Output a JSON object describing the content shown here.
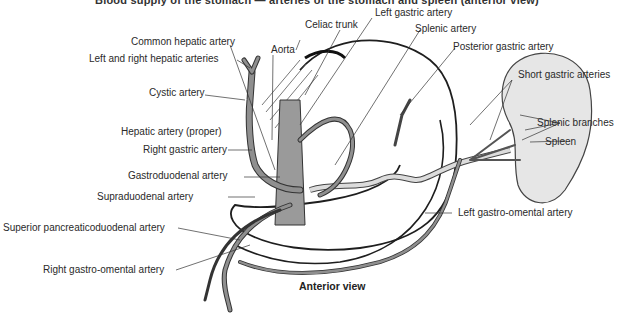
{
  "figure": {
    "caption_truncated": "Blood supply of the stomach — arteries of the stomach and spleen (anterior view)",
    "view_label": "Anterior view",
    "colors": {
      "artery_fill": "#8f8f8f",
      "artery_outline": "#333333",
      "spleen_fill": "#e6e6e6",
      "stomach_outline": "#1e1e1e",
      "splenic_artery_fill": "#dcdcdc"
    },
    "labels": {
      "left_gastric_artery": "Left gastric artery",
      "celiac_trunk": "Celiac trunk",
      "splenic_artery": "Splenic artery",
      "common_hepatic_artery": "Common hepatic artery",
      "aorta": "Aorta",
      "posterior_gastric_artery": "Posterior gastric artery",
      "left_right_hepatic_arteries": "Left and right hepatic arteries",
      "short_gastric_arteries": "Short gastric arteries",
      "cystic_artery": "Cystic artery",
      "splenic_branches": "Splenic branches",
      "spleen": "Spleen",
      "hepatic_artery_proper": "Hepatic artery (proper)",
      "right_gastric_artery": "Right gastric artery",
      "gastroduodenal_artery": "Gastroduodenal artery",
      "supraduodenal_artery": "Supraduodenal artery",
      "left_gastro_omental_artery": "Left gastro-omental artery",
      "superior_pancreaticoduodenal_artery": "Superior pancreaticoduodenal artery",
      "right_gastro_omental_artery": "Right gastro-omental artery"
    }
  }
}
